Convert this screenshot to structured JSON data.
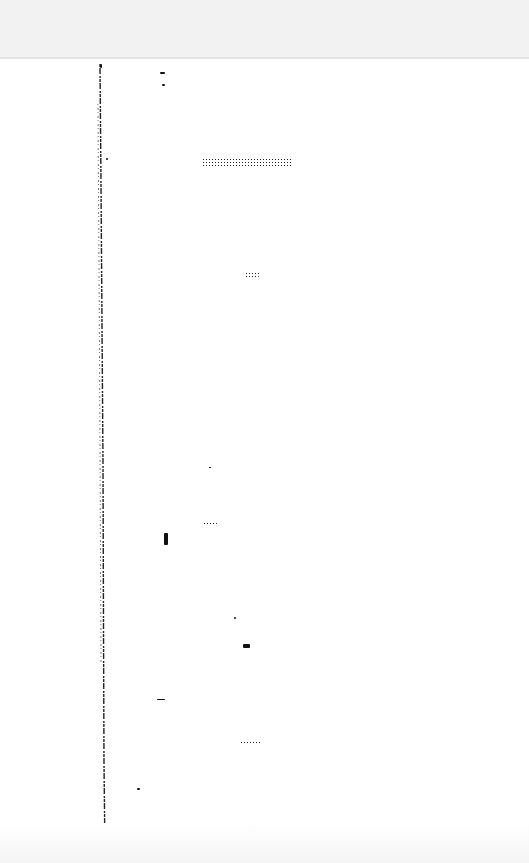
{
  "page": {
    "type": "scanned-blank-page",
    "legible_text": "",
    "background": "#ffffff",
    "ink": "#111111"
  },
  "marks": [
    {
      "x": 100,
      "y": 64,
      "w": 2,
      "h": 4
    },
    {
      "x": 160,
      "y": 72,
      "w": 5,
      "h": 2
    },
    {
      "x": 162,
      "y": 84,
      "w": 3,
      "h": 2
    },
    {
      "x": 106,
      "y": 158,
      "w": 2,
      "h": 2
    },
    {
      "x": 202,
      "y": 158,
      "w": 90,
      "h": 10
    },
    {
      "x": 245,
      "y": 272,
      "w": 14,
      "h": 5
    },
    {
      "x": 209,
      "y": 467,
      "w": 2,
      "h": 1
    },
    {
      "x": 203,
      "y": 522,
      "w": 15,
      "h": 4
    },
    {
      "x": 164,
      "y": 533,
      "w": 4,
      "h": 12
    },
    {
      "x": 234,
      "y": 617,
      "w": 2,
      "h": 2
    },
    {
      "x": 243,
      "y": 644,
      "w": 7,
      "h": 4
    },
    {
      "x": 157,
      "y": 699,
      "w": 8,
      "h": 1
    },
    {
      "x": 240,
      "y": 741,
      "w": 22,
      "h": 2
    },
    {
      "x": 137,
      "y": 788,
      "w": 3,
      "h": 2
    }
  ]
}
